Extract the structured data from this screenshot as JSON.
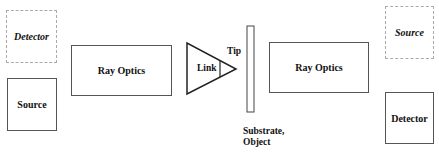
{
  "diagram": {
    "left": {
      "detector": {
        "label": "Detector",
        "style": "dashed",
        "italic": true
      },
      "source": {
        "label": "Source",
        "style": "solid",
        "italic": false
      },
      "ray_optics": {
        "label": "Ray Optics"
      }
    },
    "probe": {
      "link_label": "Link",
      "tip_label": "Tip"
    },
    "substrate": {
      "label_line1": "Substrate,",
      "label_line2": "Object"
    },
    "right": {
      "ray_optics": {
        "label": "Ray Optics"
      },
      "source": {
        "label": "Source",
        "style": "dashed",
        "italic": true
      },
      "detector": {
        "label": "Detector",
        "style": "solid",
        "italic": false
      }
    },
    "colors": {
      "line": "#333333",
      "dashed": "#aaaaaa",
      "background": "#ffffff"
    }
  }
}
